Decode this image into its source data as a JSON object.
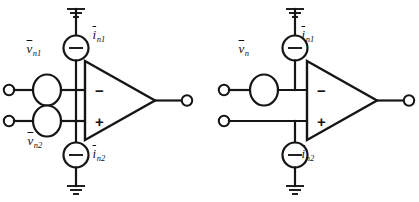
{
  "figure": {
    "type": "circuit-diagram",
    "background_color": "#ffffff",
    "line_color": "#151515"
  },
  "circuits": [
    {
      "id": "left-circuit",
      "name": "opamp-noise-model-two-voltage-sources",
      "opamp": {
        "inverting_label": "−",
        "noninverting_label": "+"
      },
      "sources": [
        {
          "id": "left-i-n1",
          "kind": "current-source",
          "label_base": "i",
          "label_sub": "n1",
          "symbol": "−"
        },
        {
          "id": "left-i-n2",
          "kind": "current-source",
          "label_base": "i",
          "label_sub": "n2",
          "symbol": "−"
        },
        {
          "id": "left-v-n1",
          "kind": "voltage-source",
          "label_base": "v",
          "label_sub": "n1",
          "symbol": ""
        },
        {
          "id": "left-v-n2",
          "kind": "voltage-source",
          "label_base": "v",
          "label_sub": "n2",
          "symbol": ""
        }
      ],
      "grounds": [
        {
          "id": "left-ground-top",
          "name": "ground-symbol"
        },
        {
          "id": "left-ground-bottom",
          "name": "ground-symbol"
        }
      ],
      "terminals": [
        {
          "id": "left-in-minus",
          "name": "input-terminal-inverting"
        },
        {
          "id": "left-in-plus",
          "name": "input-terminal-noninverting"
        },
        {
          "id": "left-out",
          "name": "output-terminal"
        }
      ]
    },
    {
      "id": "right-circuit",
      "name": "opamp-noise-model-single-voltage-source",
      "opamp": {
        "inverting_label": "−",
        "noninverting_label": "+"
      },
      "sources": [
        {
          "id": "right-i-n1",
          "kind": "current-source",
          "label_base": "i",
          "label_sub": "n1",
          "symbol": "−"
        },
        {
          "id": "right-i-n2",
          "kind": "current-source",
          "label_base": "i",
          "label_sub": "n2",
          "symbol": "−"
        },
        {
          "id": "right-v-n",
          "kind": "voltage-source",
          "label_base": "v",
          "label_sub": "n",
          "symbol": ""
        }
      ],
      "grounds": [
        {
          "id": "right-ground-top",
          "name": "ground-symbol"
        },
        {
          "id": "right-ground-bottom",
          "name": "ground-symbol"
        }
      ],
      "terminals": [
        {
          "id": "right-in-minus",
          "name": "input-terminal-inverting"
        },
        {
          "id": "right-in-plus",
          "name": "input-terminal-noninverting"
        },
        {
          "id": "right-out",
          "name": "output-terminal"
        }
      ]
    }
  ],
  "labels": {
    "left_v_n1_base": "v",
    "left_v_n1_sub": "n1",
    "left_v_n2_base": "v",
    "left_v_n2_sub": "n2",
    "left_i_n1_base": "i",
    "left_i_n1_sub": "n1",
    "left_i_n2_base": "i",
    "left_i_n2_sub": "n2",
    "right_v_n_base": "v",
    "right_v_n_sub": "n",
    "right_i_n1_base": "i",
    "right_i_n1_sub": "n1",
    "right_i_n2_base": "i",
    "right_i_n2_sub": "n2",
    "minus_sign": "−",
    "plus_sign": "+"
  }
}
